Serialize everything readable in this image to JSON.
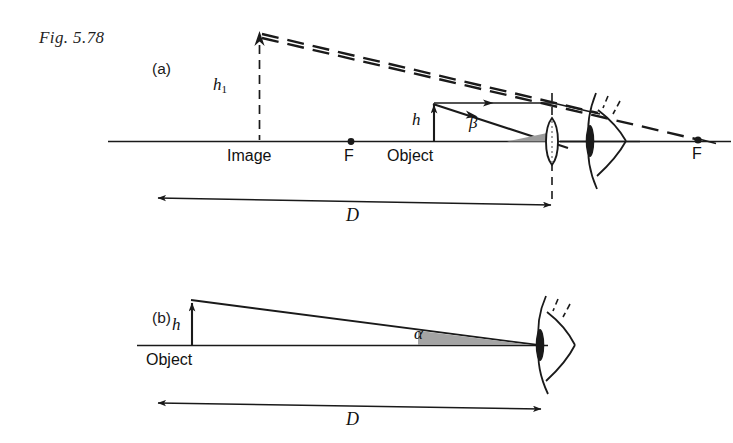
{
  "figure": {
    "caption": "Fig. 5.78",
    "panels": [
      {
        "id": "a",
        "label": "(a)",
        "object_label": "Object",
        "image_label": "Image",
        "focal_label_left": "F",
        "focal_label_right": "F",
        "object_height_symbol": "h",
        "image_height_symbol": "h",
        "image_height_subscript": "1",
        "angle_symbol": "β",
        "distance_symbol": "D"
      },
      {
        "id": "b",
        "label": "(b)",
        "object_label": "Object",
        "object_height_symbol": "h",
        "angle_symbol": "α",
        "distance_symbol": "D"
      }
    ],
    "icons": {
      "lens": "biconvex-lens-icon",
      "eye": "eye-icon",
      "arrowhead": "arrowhead-icon"
    },
    "colors": {
      "ink": "#1a1a1a",
      "background": "#ffffff",
      "wedge_fill": "#9c9c9c"
    }
  }
}
